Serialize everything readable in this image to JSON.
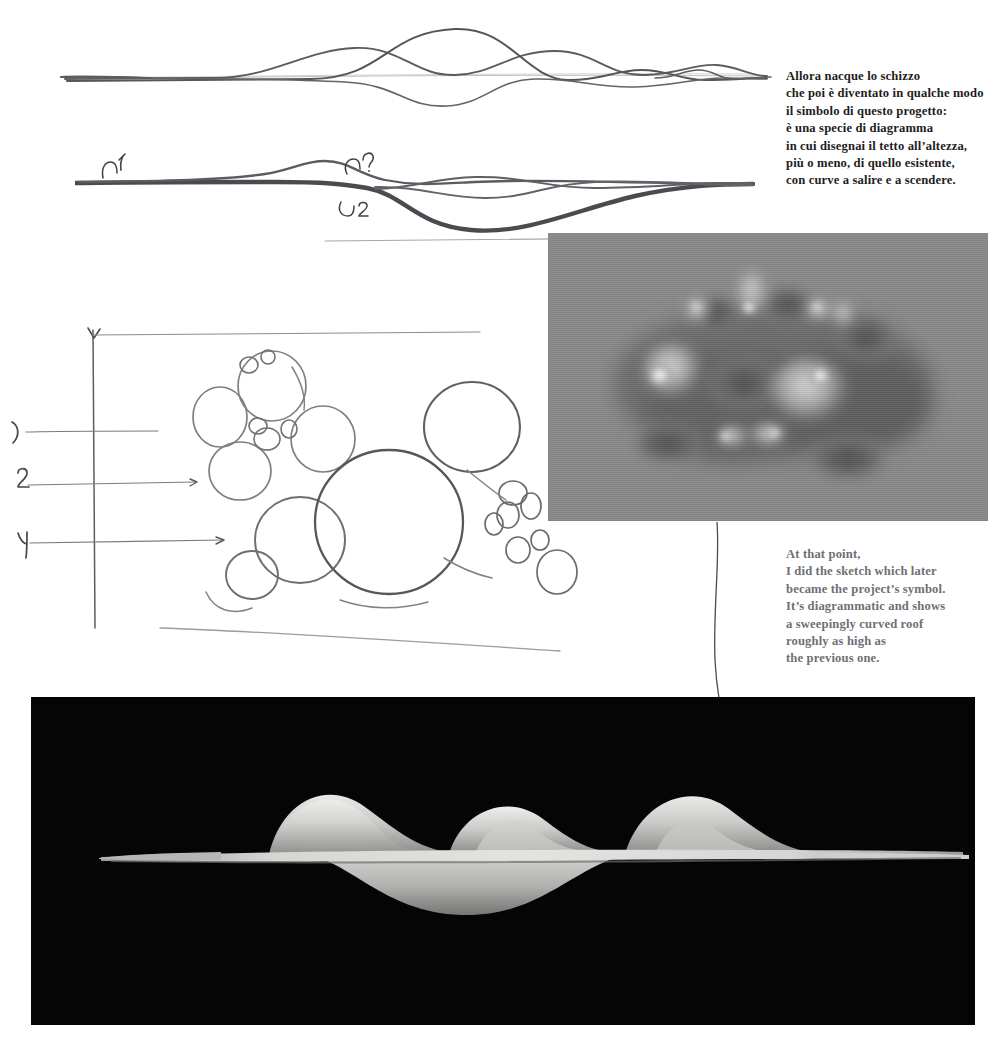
{
  "page": {
    "width": 993,
    "height": 1049,
    "background": "#ffffff"
  },
  "captions": {
    "italian": {
      "color": "#1d1d1d",
      "lines": [
        "Allora nacque lo schizzo",
        "che poi è diventato in qualche modo",
        " il simbolo di questo progetto:",
        "è una specie di diagramma",
        "in cui disegnai il tetto all’altezza,",
        "più o meno, di quello esistente,",
        "con curve a salire e a scendere."
      ]
    },
    "english": {
      "color": "#6f6f74",
      "lines": [
        "At that point,",
        "I did the sketch which later",
        "became the project’s symbol.",
        "It’s diagrammatic and shows",
        "a sweepingly curved roof",
        "roughly as high as",
        "the previous one."
      ]
    }
  },
  "annotations": {
    "wave_sketch_marks": [
      {
        "label": "1",
        "x": 128,
        "y": 162
      },
      {
        "label": "?",
        "x": 358,
        "y": 165
      },
      {
        "label": "2",
        "x": 350,
        "y": 205
      }
    ],
    "bubble_leader_numbers": [
      {
        "label": "1",
        "x": 16,
        "y": 432
      },
      {
        "label": "2",
        "x": 22,
        "y": 485
      },
      {
        "label": "4",
        "x": 22,
        "y": 543
      }
    ]
  },
  "figures": {
    "wave_top": {
      "name": "roof-profile-sketch-light",
      "description": "Thin pencil wave profiles over a horizontal datum line"
    },
    "wave_bold": {
      "name": "roof-profile-sketch-bold",
      "description": "Bold marker wave profile with handwritten numbers"
    },
    "bubbles": {
      "name": "bubble-plan-sketch",
      "description": "Overlapping hand-drawn circles plan with axis and leader lines"
    },
    "photo": {
      "name": "physical-model-photograph",
      "background": "#8a8a8a",
      "description": "Grayscale photograph of the glossy undulating roof model"
    },
    "render": {
      "name": "roof-3d-render",
      "background": "#050505",
      "description": "Black-background 3D render of the undulating roof seen edge-on"
    }
  }
}
